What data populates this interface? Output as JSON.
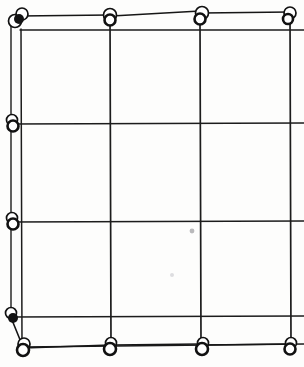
{
  "figure": {
    "width": 304,
    "height": 367,
    "background_color": "#fdfdfc",
    "ink_color": "#161616",
    "node_fill_color": "#ffffff",
    "node_stroke_color": "#111111",
    "medium": "scanned line drawing / photograph of wire grid with ring nodes"
  },
  "chart_data": {
    "type": "diagram",
    "xlabel": "",
    "ylabel": "",
    "xlim": [
      0,
      304
    ],
    "ylim": [
      0,
      367
    ],
    "grid": true,
    "legend": "none",
    "vertical_lines": [
      {
        "name": "v-left-outer",
        "x1": 11,
        "y1": 18,
        "x2": 11,
        "y2": 320,
        "width": 1.4
      },
      {
        "name": "v-left-inner",
        "x1": 21,
        "y1": 29,
        "x2": 22,
        "y2": 345,
        "width": 1.5
      },
      {
        "name": "v-mid-left",
        "x1": 110,
        "y1": 13,
        "x2": 111,
        "y2": 347,
        "width": 1.7
      },
      {
        "name": "v-mid-right",
        "x1": 200,
        "y1": 22,
        "x2": 201,
        "y2": 344,
        "width": 1.7
      },
      {
        "name": "v-right",
        "x1": 290,
        "y1": 14,
        "x2": 291,
        "y2": 345,
        "width": 1.7
      }
    ],
    "horizontal_lines": [
      {
        "name": "h-top",
        "x1": 20,
        "y1": 30,
        "x2": 304,
        "y2": 30,
        "width": 1.4
      },
      {
        "name": "h-second",
        "x1": 11,
        "y1": 124,
        "x2": 304,
        "y2": 123,
        "width": 1.4
      },
      {
        "name": "h-third",
        "x1": 11,
        "y1": 222,
        "x2": 304,
        "y2": 221,
        "width": 1.4
      },
      {
        "name": "h-fourth",
        "x1": 11,
        "y1": 317,
        "x2": 304,
        "y2": 316,
        "width": 1.4
      },
      {
        "name": "h-bottom",
        "x1": 22,
        "y1": 347,
        "x2": 304,
        "y2": 344,
        "width": 1.5
      }
    ],
    "slanted_segments": [
      {
        "name": "top-slant-a",
        "x1": 19,
        "y1": 16,
        "x2": 110,
        "y2": 15,
        "width": 1.5
      },
      {
        "name": "top-slant-b",
        "x1": 112,
        "y1": 16,
        "x2": 200,
        "y2": 11,
        "width": 1.6
      },
      {
        "name": "top-slant-c",
        "x1": 202,
        "y1": 13,
        "x2": 290,
        "y2": 12,
        "width": 1.5
      },
      {
        "name": "left-bottom-diagonal",
        "x1": 12,
        "y1": 320,
        "x2": 23,
        "y2": 347,
        "width": 1.6
      },
      {
        "name": "bottom-slant-a",
        "x1": 24,
        "y1": 348,
        "x2": 110,
        "y2": 345,
        "width": 1.6
      },
      {
        "name": "bottom-slant-b",
        "x1": 113,
        "y1": 345,
        "x2": 200,
        "y2": 344,
        "width": 1.4
      },
      {
        "name": "bottom-slant-c",
        "x1": 203,
        "y1": 345,
        "x2": 290,
        "y2": 344,
        "width": 1.5
      }
    ],
    "nodes": [
      {
        "name": "node-top-left-a",
        "cx": 15,
        "cy": 21,
        "r": 6.5,
        "style": "ring"
      },
      {
        "name": "node-top-left-b",
        "cx": 22,
        "cy": 14,
        "r": 6.0,
        "style": "ring"
      },
      {
        "name": "node-top-left-c",
        "cx": 19,
        "cy": 19,
        "r": 5.0,
        "style": "blob"
      },
      {
        "name": "node-top-1",
        "cx": 110,
        "cy": 15,
        "r": 6.5,
        "style": "ring"
      },
      {
        "name": "node-top-1b",
        "cx": 110,
        "cy": 20,
        "r": 5.5,
        "style": "ring-dark"
      },
      {
        "name": "node-top-2",
        "cx": 202,
        "cy": 13,
        "r": 6.5,
        "style": "ring"
      },
      {
        "name": "node-top-2b",
        "cx": 200,
        "cy": 19,
        "r": 5.5,
        "style": "ring-dark"
      },
      {
        "name": "node-top-3",
        "cx": 290,
        "cy": 13,
        "r": 6.0,
        "style": "ring"
      },
      {
        "name": "node-top-3b",
        "cx": 288,
        "cy": 19,
        "r": 5.0,
        "style": "ring-dark"
      },
      {
        "name": "node-left-1",
        "cx": 12,
        "cy": 120,
        "r": 5.5,
        "style": "ring"
      },
      {
        "name": "node-left-1b",
        "cx": 13,
        "cy": 126,
        "r": 5.5,
        "style": "ring-dark"
      },
      {
        "name": "node-left-2",
        "cx": 12,
        "cy": 218,
        "r": 5.5,
        "style": "ring"
      },
      {
        "name": "node-left-2b",
        "cx": 13,
        "cy": 224,
        "r": 5.5,
        "style": "ring-dark"
      },
      {
        "name": "node-left-3",
        "cx": 11,
        "cy": 313,
        "r": 5.5,
        "style": "ring"
      },
      {
        "name": "node-left-3b",
        "cx": 13,
        "cy": 318,
        "r": 5.0,
        "style": "blob"
      },
      {
        "name": "node-bottom-left",
        "cx": 24,
        "cy": 344,
        "r": 6.0,
        "style": "ring"
      },
      {
        "name": "node-bottom-left-b",
        "cx": 23,
        "cy": 350,
        "r": 6.0,
        "style": "ring-dark"
      },
      {
        "name": "node-bottom-1",
        "cx": 111,
        "cy": 343,
        "r": 5.5,
        "style": "ring"
      },
      {
        "name": "node-bottom-1b",
        "cx": 110,
        "cy": 349,
        "r": 6.0,
        "style": "ring-dark"
      },
      {
        "name": "node-bottom-2",
        "cx": 203,
        "cy": 343,
        "r": 5.5,
        "style": "ring"
      },
      {
        "name": "node-bottom-2b",
        "cx": 202,
        "cy": 349,
        "r": 6.0,
        "style": "ring-dark"
      },
      {
        "name": "node-bottom-3",
        "cx": 291,
        "cy": 343,
        "r": 5.5,
        "style": "ring"
      },
      {
        "name": "node-bottom-3b",
        "cx": 290,
        "cy": 349,
        "r": 5.5,
        "style": "ring-dark"
      }
    ],
    "specks": [
      {
        "name": "speck-center",
        "cx": 192,
        "cy": 231,
        "r": 2.4,
        "shade": "mid"
      },
      {
        "name": "speck-lower",
        "cx": 172,
        "cy": 275,
        "r": 2.0,
        "shade": "faint"
      }
    ]
  }
}
